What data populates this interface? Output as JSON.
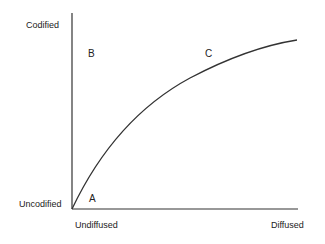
{
  "diagram": {
    "y_axis": {
      "top_label": "Codified",
      "bottom_label": "Uncodified"
    },
    "x_axis": {
      "left_label": "Undiffused",
      "right_label": "Diffused"
    },
    "points": [
      {
        "id": "A",
        "label": "A"
      },
      {
        "id": "B",
        "label": "B"
      },
      {
        "id": "C",
        "label": "C"
      }
    ],
    "curve": {
      "description": "concave increasing curve from origin toward upper right",
      "color": "#333333"
    }
  }
}
